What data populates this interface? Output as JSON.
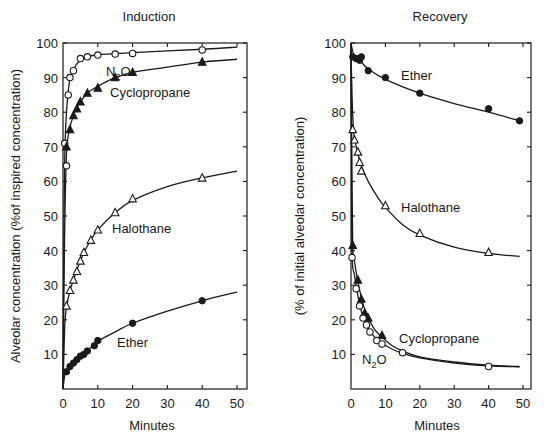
{
  "chart_data": [
    {
      "type": "line",
      "title": "Induction",
      "xlabel": "Minutes",
      "ylabel": "Alveolar concentration (%of inspired concentration)",
      "xlim": [
        0,
        50
      ],
      "ylim": [
        0,
        100
      ],
      "xticks": [
        0,
        10,
        20,
        30,
        40,
        50
      ],
      "yticks": [
        10,
        20,
        30,
        40,
        50,
        60,
        70,
        80,
        90,
        100
      ],
      "grid": false,
      "legend": "inline labels",
      "series": [
        {
          "name": "N2O",
          "label": "N₂O",
          "marker": "open-circle",
          "points": [
            [
              0.5,
              71
            ],
            [
              1,
              64.5
            ],
            [
              1.5,
              85
            ],
            [
              2,
              90
            ],
            [
              3,
              92
            ],
            [
              5,
              95.5
            ],
            [
              7,
              96
            ],
            [
              10,
              96.5
            ],
            [
              15,
              96.8
            ],
            [
              20,
              97
            ],
            [
              40,
              98
            ]
          ],
          "curve": [
            [
              0,
              0
            ],
            [
              0.3,
              50
            ],
            [
              0.6,
              71
            ],
            [
              1,
              80
            ],
            [
              1.5,
              86
            ],
            [
              2,
              89.5
            ],
            [
              3,
              92.5
            ],
            [
              5,
              95
            ],
            [
              7,
              96
            ],
            [
              10,
              96.6
            ],
            [
              20,
              97.2
            ],
            [
              40,
              98.2
            ],
            [
              50,
              98.8
            ]
          ]
        },
        {
          "name": "Cyclopropane",
          "label": "Cyclopropane",
          "marker": "filled-triangle",
          "points": [
            [
              1,
              70
            ],
            [
              2,
              75
            ],
            [
              3,
              79
            ],
            [
              4,
              81
            ],
            [
              5,
              83
            ],
            [
              7,
              85.5
            ],
            [
              10,
              87
            ],
            [
              15,
              90
            ],
            [
              20,
              91.5
            ],
            [
              40,
              94.5
            ]
          ],
          "curve": [
            [
              0,
              0
            ],
            [
              0.4,
              40
            ],
            [
              1,
              68
            ],
            [
              2,
              75.5
            ],
            [
              3,
              79
            ],
            [
              4,
              81.5
            ],
            [
              5,
              83
            ],
            [
              7,
              85.5
            ],
            [
              10,
              87.5
            ],
            [
              15,
              90
            ],
            [
              20,
              91.5
            ],
            [
              30,
              93
            ],
            [
              40,
              94.5
            ],
            [
              50,
              95.3
            ]
          ]
        },
        {
          "name": "Halothane",
          "label": "Halothane",
          "marker": "open-triangle",
          "points": [
            [
              1,
              24
            ],
            [
              2,
              28.5
            ],
            [
              3,
              31.5
            ],
            [
              4,
              34
            ],
            [
              5,
              37
            ],
            [
              6,
              39.5
            ],
            [
              8,
              43
            ],
            [
              10,
              46
            ],
            [
              15,
              51
            ],
            [
              20,
              55
            ],
            [
              40,
              61
            ]
          ],
          "curve": [
            [
              0,
              0
            ],
            [
              0.5,
              18
            ],
            [
              1,
              23.5
            ],
            [
              2,
              28.5
            ],
            [
              3,
              31.5
            ],
            [
              4,
              34.5
            ],
            [
              5,
              37
            ],
            [
              6,
              39.5
            ],
            [
              8,
              43
            ],
            [
              10,
              46
            ],
            [
              15,
              51
            ],
            [
              20,
              54.5
            ],
            [
              30,
              58.5
            ],
            [
              40,
              61
            ],
            [
              50,
              63
            ]
          ]
        },
        {
          "name": "Ether",
          "label": "Ether",
          "marker": "filled-circle",
          "points": [
            [
              1,
              5
            ],
            [
              2,
              6.5
            ],
            [
              3,
              7.5
            ],
            [
              4,
              8.5
            ],
            [
              5,
              9.5
            ],
            [
              6,
              10
            ],
            [
              7,
              11
            ],
            [
              9,
              12.5
            ],
            [
              10,
              14
            ],
            [
              20,
              19
            ],
            [
              40,
              25.5
            ]
          ],
          "curve": [
            [
              0,
              0
            ],
            [
              0.5,
              4
            ],
            [
              1,
              5
            ],
            [
              2,
              6.5
            ],
            [
              4,
              8.5
            ],
            [
              6,
              10.5
            ],
            [
              8,
              12
            ],
            [
              10,
              13.8
            ],
            [
              15,
              16.5
            ],
            [
              20,
              19
            ],
            [
              30,
              22.5
            ],
            [
              40,
              25.5
            ],
            [
              50,
              28
            ]
          ]
        }
      ],
      "labels": [
        {
          "text": "N₂O",
          "x": 106,
          "y": 76
        },
        {
          "text": "Cyclopropane",
          "x": 110,
          "y": 97
        },
        {
          "text": "Halothane",
          "x": 112,
          "y": 233
        },
        {
          "text": "Ether",
          "x": 117,
          "y": 347
        }
      ]
    },
    {
      "type": "line",
      "title": "Recovery",
      "xlabel": "Minutes",
      "ylabel": "(% of initial alveolar concentration)",
      "xlim": [
        0,
        50
      ],
      "ylim": [
        0,
        100
      ],
      "xticks": [
        0,
        10,
        20,
        30,
        40,
        50
      ],
      "yticks": [
        10,
        20,
        30,
        40,
        50,
        60,
        70,
        80,
        90,
        100
      ],
      "grid": false,
      "legend": "inline labels",
      "series": [
        {
          "name": "Ether",
          "label": "Ether",
          "marker": "filled-circle",
          "points": [
            [
              0.5,
              96
            ],
            [
              1.5,
              95.5
            ],
            [
              2.5,
              95
            ],
            [
              3,
              96
            ],
            [
              5,
              92
            ],
            [
              10,
              90
            ],
            [
              20,
              85.5
            ],
            [
              40,
              81
            ],
            [
              49,
              77.5
            ]
          ],
          "curve": [
            [
              0,
              100
            ],
            [
              0.5,
              97.5
            ],
            [
              1,
              96.5
            ],
            [
              2,
              95.5
            ],
            [
              3,
              94.5
            ],
            [
              5,
              92.5
            ],
            [
              10,
              89.5
            ],
            [
              20,
              85.5
            ],
            [
              30,
              82.5
            ],
            [
              40,
              80
            ],
            [
              49,
              77.5
            ]
          ]
        },
        {
          "name": "Halothane",
          "label": "Halothane",
          "marker": "open-triangle",
          "points": [
            [
              0.5,
              75
            ],
            [
              1,
              72
            ],
            [
              2,
              68.5
            ],
            [
              2.5,
              65.5
            ],
            [
              3,
              63
            ],
            [
              10,
              53
            ],
            [
              20,
              45
            ],
            [
              40,
              39.5
            ]
          ],
          "curve": [
            [
              0,
              98
            ],
            [
              0.3,
              85
            ],
            [
              0.6,
              77
            ],
            [
              1,
              72.5
            ],
            [
              2,
              68
            ],
            [
              3,
              64.5
            ],
            [
              5,
              60
            ],
            [
              8,
              55
            ],
            [
              10,
              52.5
            ],
            [
              15,
              47.5
            ],
            [
              20,
              44.5
            ],
            [
              30,
              41
            ],
            [
              40,
              39.2
            ],
            [
              49,
              38.3
            ]
          ]
        },
        {
          "name": "Cyclopropane",
          "label": "Cyclopropane",
          "marker": "filled-triangle",
          "points": [
            [
              0.5,
              41.5
            ],
            [
              2,
              31.5
            ],
            [
              3,
              26
            ],
            [
              4,
              22
            ],
            [
              5,
              20.5
            ],
            [
              9,
              15.5
            ]
          ],
          "curve": [
            [
              0,
              100
            ],
            [
              0.2,
              70
            ],
            [
              0.5,
              42
            ],
            [
              1,
              37
            ],
            [
              2,
              31
            ],
            [
              3,
              26.5
            ],
            [
              4,
              23
            ],
            [
              5,
              20.5
            ],
            [
              7,
              17
            ],
            [
              9,
              15
            ],
            [
              12,
              12.5
            ],
            [
              15,
              11
            ],
            [
              20,
              9.3
            ],
            [
              30,
              7.8
            ],
            [
              40,
              6.9
            ],
            [
              49,
              6.5
            ]
          ]
        },
        {
          "name": "N2O",
          "label": "N₂O",
          "marker": "open-circle",
          "points": [
            [
              0.3,
              38
            ],
            [
              1.5,
              29
            ],
            [
              2.5,
              24
            ],
            [
              3.5,
              20.5
            ],
            [
              4.5,
              18.5
            ],
            [
              5.5,
              16.5
            ],
            [
              7.5,
              14
            ],
            [
              9,
              13
            ],
            [
              15,
              10.5
            ],
            [
              40,
              6.5
            ]
          ],
          "curve": [
            [
              0,
              100
            ],
            [
              0.15,
              70
            ],
            [
              0.3,
              39
            ],
            [
              1,
              33
            ],
            [
              2,
              27
            ],
            [
              3,
              22.5
            ],
            [
              4,
              19.5
            ],
            [
              5,
              17.5
            ],
            [
              7,
              14.8
            ],
            [
              9,
              13.2
            ],
            [
              12,
              11.5
            ],
            [
              15,
              10.3
            ],
            [
              20,
              9
            ],
            [
              30,
              7.5
            ],
            [
              40,
              6.7
            ],
            [
              49,
              6.4
            ]
          ]
        }
      ],
      "labels": [
        {
          "text": "Ether",
          "x": 401,
          "y": 80
        },
        {
          "text": "Halothane",
          "x": 401,
          "y": 212
        },
        {
          "text": "Cyclopropane",
          "x": 399,
          "y": 343
        },
        {
          "text": "N₂O",
          "x": 362,
          "y": 364
        }
      ]
    }
  ],
  "panels": {
    "left": {
      "title": "Induction",
      "xlabel": "Minutes",
      "ylabel": "Alveolar concentration (%of inspired concentration)"
    },
    "right": {
      "title": "Recovery",
      "xlabel": "Minutes",
      "ylabel": "(% of initial alveolar concentration)"
    }
  }
}
